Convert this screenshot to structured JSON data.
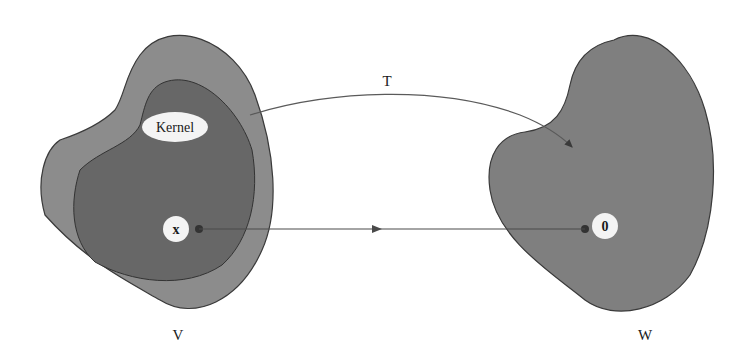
{
  "diagram": {
    "mapping_label": "T",
    "domain_label": "V",
    "codomain_label": "W",
    "kernel_label": "Kernel",
    "vector_label": "x",
    "zero_label": "0",
    "colors": {
      "outer_domain": "#8a8a8a",
      "kernel_region": "#666666",
      "codomain": "#7d7d7d",
      "outline": "#3c3c3c",
      "arrow": "#4a4a4a",
      "label_bubble": "#f4f4f4"
    }
  }
}
